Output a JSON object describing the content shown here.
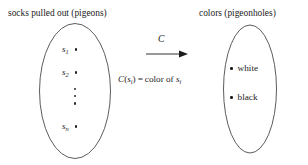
{
  "figure": {
    "background_color": "#ffffff",
    "stroke_color": "#4a4a4a",
    "text_color": "#1c1c1c",
    "width": 308,
    "height": 165
  },
  "left_set": {
    "caption": "socks pulled out (pigeons)",
    "shape": "ellipse",
    "elements": [
      {
        "symbol": "s",
        "subscript": "1",
        "label": "s1"
      },
      {
        "symbol": "s",
        "subscript": "2",
        "label": "s2"
      },
      {
        "symbol": "",
        "subscript": "",
        "label": "⋮"
      },
      {
        "symbol": "s",
        "subscript": "n",
        "label": "sn"
      }
    ]
  },
  "right_set": {
    "caption": "colors (pigeonholes)",
    "shape": "ellipse",
    "elements": [
      {
        "label": "white"
      },
      {
        "label": "black"
      }
    ]
  },
  "mapping": {
    "arrow_label": "C",
    "arrow_icon": "right-arrow-icon",
    "formula": {
      "function_name": "C",
      "open_paren": "(",
      "argument_symbol": "s",
      "argument_subscript": "i",
      "close_paren": ")",
      "equals": "=",
      "result_text": "color of",
      "result_symbol": "s",
      "result_subscript": "i",
      "full": "C(s_i) = color of s_i"
    }
  }
}
